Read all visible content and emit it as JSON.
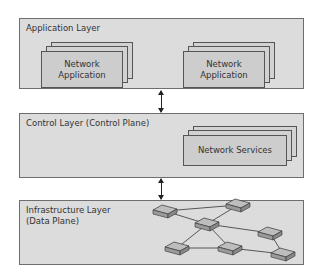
{
  "diagram": {
    "layers": [
      {
        "title": "Application Layer",
        "items": [
          "Network\nApplication",
          "Network\nApplication"
        ]
      },
      {
        "title": "Control Layer (Control Plane)",
        "items": [
          "Network Services"
        ]
      },
      {
        "title": "Infrastructure Layer\n(Data Plane)",
        "items": [
          "network-switch-graph"
        ]
      }
    ],
    "app": {
      "title": "Application Layer",
      "app1_line1": "Network",
      "app1_line2": "Application",
      "app2_line1": "Network",
      "app2_line2": "Application"
    },
    "control": {
      "title": "Control Layer (Control Plane)",
      "services": "Network Services"
    },
    "infra": {
      "title_line1": "Infrastructure Layer",
      "title_line2": "(Data Plane)"
    },
    "connectors": [
      "bidirectional-arrow",
      "bidirectional-arrow"
    ],
    "colors": {
      "layer_fill": "#dcdcdc",
      "card_fill": "#cdcdcd",
      "border": "#555555"
    }
  }
}
